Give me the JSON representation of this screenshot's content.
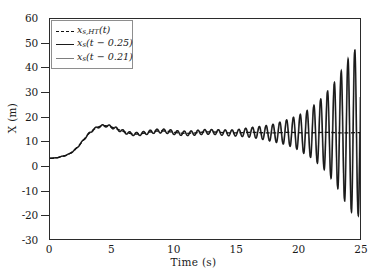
{
  "chart_data": {
    "type": "line",
    "title": "",
    "xlabel": "Time (s)",
    "ylabel": "X (m)",
    "xlim": [
      0,
      25
    ],
    "ylim": [
      -30,
      60
    ],
    "xticks": [
      0,
      5,
      10,
      15,
      20,
      25
    ],
    "yticks": [
      60,
      50,
      40,
      30,
      20,
      10,
      0,
      -10,
      -20,
      -30
    ],
    "grid": false,
    "legend_position": "upper-left",
    "series": [
      {
        "name": "x_{s,HT}(t)",
        "label_main": "x",
        "label_sub": "s,HT",
        "label_arg": "(t)",
        "style": "dashed",
        "color": "#111111",
        "width": 1.4,
        "description": "Hilbert transform envelope reference response, rises from 3 m to a steady mean near 13.5 m with small ripple, then mildly growing oscillation after 15 s",
        "x": [
          0,
          0.5,
          1,
          1.5,
          2,
          2.5,
          3,
          3.5,
          4,
          4.5,
          5,
          5.5,
          6,
          6.5,
          7,
          7.5,
          8,
          8.5,
          9,
          9.5,
          10,
          10.5,
          11,
          11.5,
          12,
          12.5,
          13,
          13.5,
          14,
          14.5,
          15,
          15.5,
          16,
          16.5,
          17,
          17.5,
          18,
          18.5,
          19,
          19.5,
          20,
          20.5,
          21,
          21.5,
          22,
          22.5,
          23,
          23.5,
          24,
          24.5,
          25
        ],
        "y": [
          3.0,
          3.2,
          3.8,
          4.6,
          6.4,
          9.2,
          12.4,
          14.8,
          16.1,
          16.4,
          15.8,
          14.8,
          13.8,
          13.1,
          12.9,
          13.2,
          13.7,
          14.1,
          14.2,
          14.0,
          13.6,
          13.3,
          13.2,
          13.3,
          13.6,
          13.8,
          13.8,
          13.7,
          13.5,
          13.4,
          13.4,
          13.5,
          13.6,
          13.6,
          13.5,
          13.4,
          13.4,
          13.5,
          13.6,
          13.6,
          13.5,
          13.4,
          13.4,
          13.5,
          13.6,
          13.6,
          13.5,
          13.4,
          13.4,
          13.5,
          13.5
        ]
      },
      {
        "name": "x_s(t - 0.25)",
        "label_main": "x",
        "label_sub": "s",
        "label_arg": "(t − 0.25)",
        "style": "solid",
        "color": "#1b1b1b",
        "width": 1.5,
        "description": "Delayed response with 0.25 s delay; unstable divergent oscillation growing after 15 s reaching +47 m and -25 m by 25 s",
        "oscillation_onset_s": 14.5,
        "oscillation_period_s": 0.55,
        "mean_level": 13.5,
        "final_peak": 47,
        "final_trough": -25
      },
      {
        "name": "x_s(t - 0.21)",
        "label_main": "x",
        "label_sub": "s",
        "label_arg": "(t − 0.21)",
        "style": "solid",
        "color": "#7d7d7d",
        "width": 1.1,
        "description": "Delayed response with 0.21 s delay; nearly identical divergent oscillation overlapping the 0.25 s trace",
        "oscillation_onset_s": 14.5,
        "oscillation_period_s": 0.55,
        "mean_level": 13.5,
        "final_peak": 46,
        "final_trough": -24
      }
    ],
    "envelope_growth": {
      "t": [
        0,
        5,
        10,
        13,
        15,
        16,
        17,
        18,
        19,
        20,
        21,
        22,
        23,
        24,
        24.5,
        25
      ],
      "amplitude": [
        0,
        0.6,
        0.9,
        1.0,
        1.3,
        1.9,
        2.6,
        3.6,
        5.0,
        7.0,
        10.0,
        14.5,
        21.0,
        30.0,
        34.0,
        34.0
      ]
    }
  },
  "axes": {
    "x_title": "Time (s)",
    "y_title": "X (m)"
  }
}
